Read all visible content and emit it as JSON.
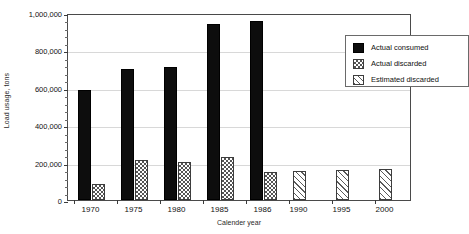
{
  "chart_data": {
    "type": "bar",
    "title": "",
    "xlabel": "Calender year",
    "ylabel": "Load usage, tons",
    "categories": [
      "1970",
      "1975",
      "1980",
      "1985",
      "1986",
      "1990",
      "1995",
      "2000"
    ],
    "ylim": [
      0,
      1000000
    ],
    "y_ticks": [
      0,
      200000,
      400000,
      600000,
      800000,
      1000000
    ],
    "y_tick_labels": [
      "0",
      "200,000",
      "400,000",
      "600,000",
      "800,000",
      "1,000,000"
    ],
    "y_minor_tick_count": 4,
    "grid": true,
    "grid_axis": "y",
    "legend_position": "top-right",
    "series": [
      {
        "name": "Actual consumed",
        "pattern": "solid-black",
        "values": [
          590000,
          700000,
          710000,
          940000,
          955000,
          null,
          null,
          null
        ]
      },
      {
        "name": "Actual discarded",
        "pattern": "cross-hatch",
        "values": [
          85000,
          213000,
          205000,
          230000,
          150000,
          null,
          null,
          null
        ]
      },
      {
        "name": "Estimated discarded",
        "pattern": "diagonal-hatch",
        "values": [
          null,
          null,
          null,
          null,
          null,
          155000,
          160000,
          165000
        ]
      }
    ]
  },
  "legend": {
    "entries": [
      {
        "label": "Actual consumed",
        "pattern": "consumed"
      },
      {
        "label": "Actual discarded",
        "pattern": "discarded"
      },
      {
        "label": "Estimated discarded",
        "pattern": "estimated"
      }
    ]
  }
}
